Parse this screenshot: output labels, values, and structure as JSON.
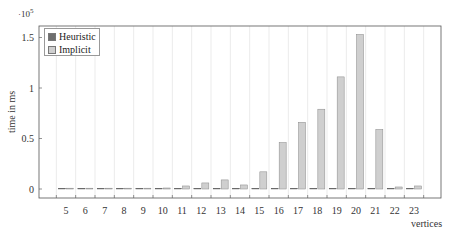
{
  "chart_data": {
    "type": "bar",
    "title": "",
    "xlabel": "vertices",
    "ylabel": "time in ms",
    "y_scale_label": "·10^5",
    "y_multiplier": 100000,
    "ylim": [
      -0.07,
      1.62
    ],
    "yticks": [
      0,
      0.5,
      1,
      1.5
    ],
    "ytick_labels": [
      "0",
      "0.5",
      "1",
      "1.5"
    ],
    "grid": "vertical",
    "legend_position": "top-left",
    "categories": [
      "5",
      "6",
      "7",
      "8",
      "9",
      "10",
      "11",
      "12",
      "13",
      "14",
      "15",
      "16",
      "17",
      "18",
      "19",
      "20",
      "21",
      "22",
      "23"
    ],
    "series": [
      {
        "name": "Heuristic",
        "color": "#6e6e6e",
        "values": [
          0.001,
          0.001,
          0.001,
          0.001,
          0.001,
          0.001,
          0.001,
          0.001,
          0.001,
          0.001,
          0.001,
          0.001,
          0.001,
          0.001,
          0.001,
          0.001,
          0.001,
          0.001,
          0.001
        ]
      },
      {
        "name": "Implicit",
        "color": "#cfcfcf",
        "values": [
          0,
          0,
          0,
          0,
          0.002,
          0.01,
          0.03,
          0.06,
          0.09,
          0.04,
          0.17,
          0.46,
          0.66,
          0.79,
          1.11,
          1.53,
          0.59,
          0.02,
          0.03
        ]
      }
    ]
  },
  "legend": {
    "items": [
      {
        "label": "Heuristic",
        "color": "#6e6e6e"
      },
      {
        "label": "Implicit",
        "color": "#cfcfcf"
      }
    ]
  }
}
